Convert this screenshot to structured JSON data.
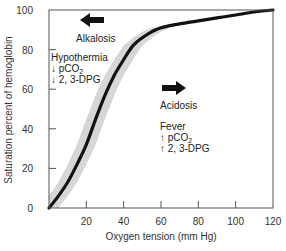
{
  "chart_data": {
    "type": "line",
    "title": "",
    "xlabel": "Oxygen tension (mm Hg)",
    "ylabel": "Saturation percent of hemoglobin",
    "xlim": [
      0,
      120
    ],
    "ylim": [
      0,
      100
    ],
    "x_ticks": [
      20,
      40,
      60,
      80,
      100,
      120
    ],
    "y_ticks": [
      0,
      20,
      40,
      60,
      80,
      100
    ],
    "grid": false,
    "series": [
      {
        "name": "Oxyhemoglobin dissociation curve",
        "x": [
          0,
          5,
          10,
          15,
          20,
          25,
          30,
          35,
          40,
          45,
          50,
          55,
          60,
          70,
          80,
          90,
          100,
          110,
          120
        ],
        "y": [
          0,
          6,
          13,
          22,
          32,
          45,
          57,
          67,
          75,
          82,
          86,
          89,
          91,
          93,
          94.5,
          96,
          97.5,
          99,
          100
        ]
      }
    ],
    "band": {
      "name": "Shift range",
      "x_range": [
        0,
        60
      ],
      "half_width_x": 5,
      "color": "#d6d6d6"
    },
    "annotations": [
      {
        "id": "left_shift",
        "arrow": "left",
        "label": "Alkalosis",
        "x": 20,
        "y": 93
      },
      {
        "id": "left_factors",
        "lines": [
          "Hypothermia",
          "↓ pCO2",
          "↓ 2, 3-DPG"
        ]
      },
      {
        "id": "right_shift",
        "arrow": "right",
        "label": "Acidosis",
        "x": 65,
        "y": 60
      },
      {
        "id": "right_factors",
        "lines": [
          "Fever",
          "↑ pCO2",
          "↑ 2, 3-DPG"
        ]
      }
    ]
  },
  "labels": {
    "xlabel": "Oxygen tension (mm Hg)",
    "ylabel": "Saturation percent of hemoglobin",
    "alkalosis": "Alkalosis",
    "acidosis": "Acidosis",
    "hypothermia": "Hypothermia",
    "fever": "Fever",
    "down_arrow": "↓",
    "up_arrow": "↑",
    "pco": " pCO",
    "sub2": "2",
    "dpg": " 2, 3-DPG"
  }
}
